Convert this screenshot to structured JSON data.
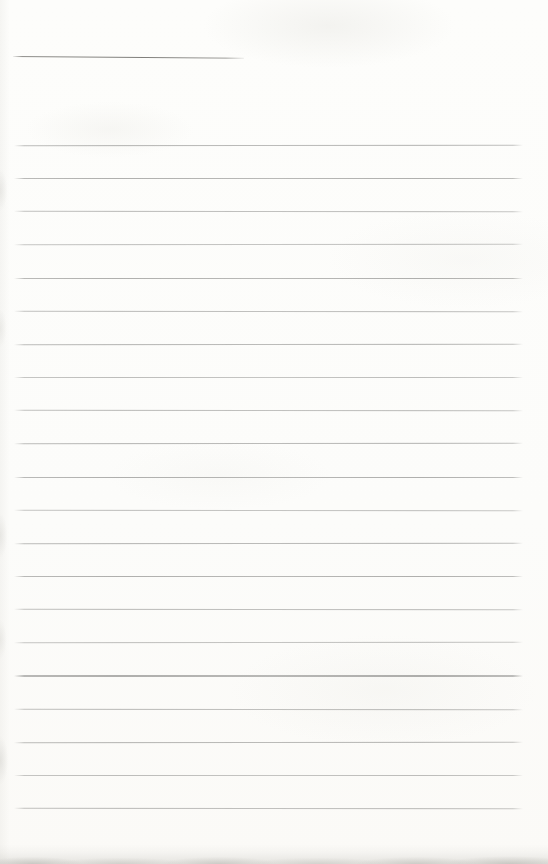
{
  "page": {
    "type": "blank-lined-notebook-page",
    "title_text": "",
    "has_title_underline": true,
    "ruled_line_count": 21
  },
  "colors": {
    "paper": "#fcfcfa",
    "rule_line": "#a9a9a7",
    "title_underline": "#6c6b67",
    "bottom_edge_shadow": "#a6a59f"
  }
}
